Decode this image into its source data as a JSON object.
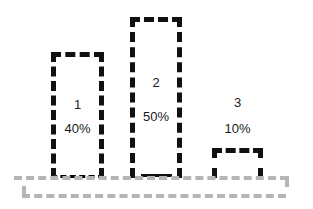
{
  "chart_data": {
    "type": "bar",
    "title": "",
    "subtitle": "",
    "xlabel": "",
    "ylabel": "",
    "categories": [
      "1",
      "2",
      "3"
    ],
    "values": [
      40,
      50,
      10
    ],
    "value_labels": [
      "40%",
      "50%",
      "10%"
    ],
    "ylim": [
      0,
      60
    ],
    "grid": false,
    "legend": null,
    "style": {
      "bar_fill": "none",
      "bar_border_color": "#111111",
      "bar_border_style": "dashed",
      "axis_line_color": "#b5b5b5",
      "axis_line_style": "dashed",
      "background": "#ffffff",
      "label_color": "#1a1a1a"
    }
  },
  "chart": {
    "bars": [
      {
        "name": "1",
        "value_label": "40%"
      },
      {
        "name": "2",
        "value_label": "50%"
      },
      {
        "name": "3",
        "value_label": "10%"
      }
    ]
  }
}
